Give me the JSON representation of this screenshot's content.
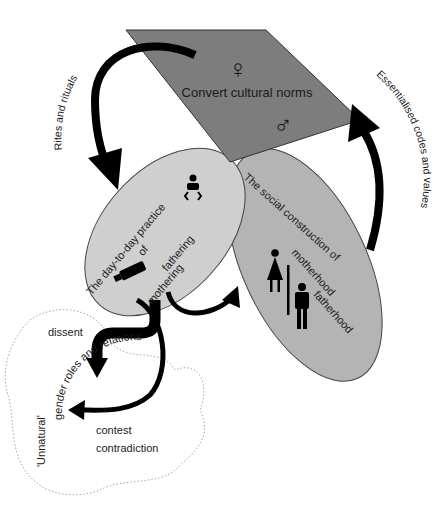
{
  "diagram": {
    "top_plane": {
      "label": "Convert cultural norms",
      "symbols": {
        "female": "♀",
        "male": "♂"
      },
      "fill": "#7d7d7d"
    },
    "left_ellipse": {
      "title_line1": "The day-to-day practice",
      "title_line2": "of",
      "term_a": "mothering",
      "term_b": "fathering",
      "fill": "#cfcfcf"
    },
    "right_ellipse": {
      "title": "The social construction of",
      "term_a": "motherhood",
      "term_b": "fatherhood",
      "fill": "#b4b4b4"
    },
    "arrows": {
      "left_arc_label": "Rites and rituals",
      "right_arc_label": "Essentialised codes and values"
    },
    "cloud": {
      "title_line1": "'Unnatural'",
      "title_line2": "gender roles and relations",
      "word_1": "dissent",
      "word_2": "contest",
      "word_3": "contradiction"
    }
  }
}
